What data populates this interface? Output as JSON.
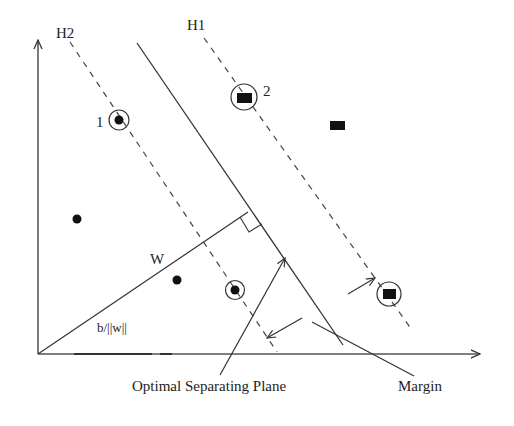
{
  "diagram": {
    "labels": {
      "h2": "H2",
      "h1": "H1",
      "point1": "1",
      "point2": "2",
      "w": "W",
      "bias": "b/||w||",
      "plane": "Optimal Separating Plane",
      "margin": "Margin"
    },
    "colors": {
      "line": "#333333",
      "point": "#111111",
      "background": "#ffffff"
    },
    "class_circle_points": [
      {
        "id": "p1",
        "x": 119,
        "y": 120,
        "support_vector": true
      },
      {
        "id": "p3",
        "x": 77,
        "y": 219,
        "support_vector": false
      },
      {
        "id": "p4",
        "x": 177,
        "y": 280,
        "support_vector": false
      },
      {
        "id": "p5",
        "x": 235,
        "y": 290,
        "support_vector": true
      }
    ],
    "class_square_points": [
      {
        "id": "p2",
        "x": 244,
        "y": 97,
        "support_vector": true
      },
      {
        "id": "p6",
        "x": 337,
        "y": 125,
        "support_vector": false
      },
      {
        "id": "p7",
        "x": 389,
        "y": 294,
        "support_vector": true
      }
    ]
  }
}
